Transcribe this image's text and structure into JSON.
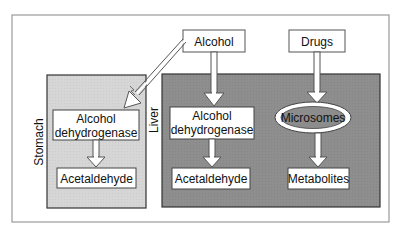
{
  "diagram": {
    "sources": {
      "alcohol": "Alcohol",
      "drugs": "Drugs"
    },
    "stomach": {
      "label": "Stomach",
      "enzyme_line1": "Alcohol",
      "enzyme_line2": "dehydrogenase",
      "product": "Acetaldehyde"
    },
    "liver": {
      "label": "Liver",
      "enzyme_line1": "Alcohol",
      "enzyme_line2": "dehydrogenase",
      "product": "Acetaldehyde",
      "microsomes": "Microsomes",
      "metabolites": "Metabolites"
    },
    "colors": {
      "frame_border": "#8a8a8a",
      "stomach_fill": "#d9d9d9",
      "liver_fill": "#8c8c8c",
      "box_fill": "#ffffff",
      "ellipse_fill": "#8c8c8c"
    }
  }
}
